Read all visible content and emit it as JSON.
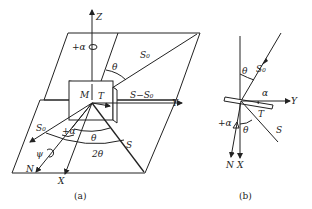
{
  "figure_a": {
    "caption": "(a)",
    "labels": {
      "z_axis": "Z",
      "y_axis": "Y",
      "x_axis": "X",
      "rotation_alpha": "+α",
      "theta_top": "θ",
      "s0_top": "S₀",
      "m_label": "M",
      "t_label": "T",
      "s_minus_s0": "S−S₀",
      "s0_left": "S₀",
      "plus_alpha": "+α",
      "theta_bottom": "θ",
      "two_theta": "2θ",
      "s_label": "S",
      "psi": "ψ",
      "n_label": "N"
    }
  },
  "figure_b": {
    "caption": "(b)",
    "labels": {
      "theta_top": "θ",
      "s0": "S₀",
      "alpha": "α",
      "y_axis": "Y",
      "t_label": "T",
      "plus_alpha": "+α",
      "theta_bottom": "θ",
      "s_label": "S",
      "n_label": "N",
      "x_axis": "X"
    }
  }
}
